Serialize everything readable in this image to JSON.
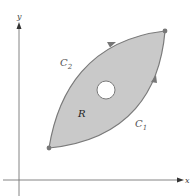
{
  "diagram": {
    "axes": {
      "x_label": "x",
      "y_label": "y"
    },
    "region": {
      "label": "R",
      "fill_color": "#c9c9c9",
      "outline_color": "#7a7a7a",
      "hole": true
    },
    "curves": [
      {
        "name": "C1",
        "label_main": "C",
        "label_sub": "1",
        "direction": "bottom-left to top-right, lower boundary"
      },
      {
        "name": "C2",
        "label_main": "C",
        "label_sub": "2",
        "direction": "bottom-left to top-right, upper boundary"
      }
    ],
    "endpoints": [
      {
        "name": "start",
        "position": "bottom-left"
      },
      {
        "name": "end",
        "position": "top-right"
      }
    ]
  }
}
